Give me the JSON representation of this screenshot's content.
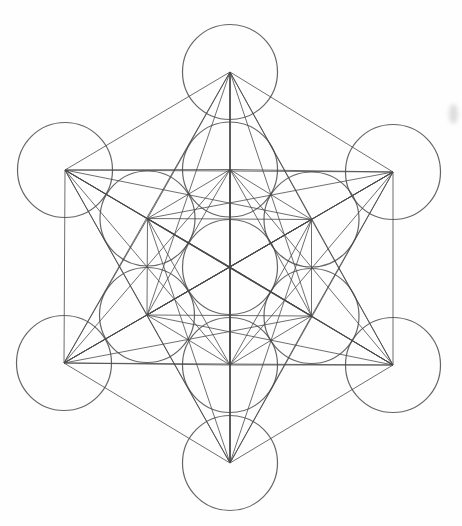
{
  "figure": {
    "semantic_name": "metatrons-cube-sacred-geometry-diagram",
    "canvas": {
      "width": 462,
      "height": 526,
      "background": "#fefefe"
    },
    "stroke_color": "#4a4a4a",
    "line_stroke_width": 1,
    "circle_stroke_width": 1.2,
    "line_opacity": 0.8,
    "circle_opacity": 0.85,
    "circle_radius": 47.5,
    "circles": [
      {
        "id": "center",
        "x": 230,
        "y": 267
      },
      {
        "id": "inner-top",
        "x": 230,
        "y": 169.5
      },
      {
        "id": "inner-upper-right",
        "x": 311.5,
        "y": 219.5
      },
      {
        "id": "inner-lower-right",
        "x": 311.5,
        "y": 316
      },
      {
        "id": "inner-bottom",
        "x": 230,
        "y": 365
      },
      {
        "id": "inner-lower-left",
        "x": 147,
        "y": 315
      },
      {
        "id": "inner-upper-left",
        "x": 147.5,
        "y": 218.5
      },
      {
        "id": "outer-top",
        "x": 230,
        "y": 72
      },
      {
        "id": "outer-upper-right",
        "x": 393,
        "y": 172
      },
      {
        "id": "outer-lower-right",
        "x": 393,
        "y": 365
      },
      {
        "id": "outer-bottom",
        "x": 230,
        "y": 463
      },
      {
        "id": "outer-lower-left",
        "x": 64,
        "y": 363
      },
      {
        "id": "outer-upper-left",
        "x": 65,
        "y": 170
      }
    ],
    "connections": "all-pairs-of-circle-centers",
    "connection_count": 78,
    "scan_artifact": {
      "x": 449,
      "y": 104,
      "width": 9,
      "height": 20,
      "color": "#c2c2c2"
    }
  }
}
